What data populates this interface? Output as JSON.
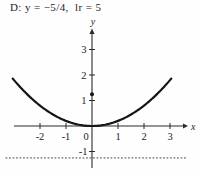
{
  "title": "D: y = −5/4,  lr = 5",
  "chart_data": {
    "type": "line",
    "title": "D: y = −5/4,  lr = 5",
    "equation": "y = x^2/5",
    "coefficient": 0.2,
    "x_range": [
      -3.05,
      3.05
    ],
    "xlabel": "x",
    "ylabel": "y",
    "x_tick_values": [
      -2,
      -1,
      1,
      2,
      3
    ],
    "x_tick_labels": [
      "-2",
      "-1",
      "1",
      "2",
      "3"
    ],
    "origin_label": "0",
    "y_tick_values": [
      1,
      2,
      3
    ],
    "y_tick_labels": [
      "1",
      "2",
      "3"
    ],
    "neg_y_tick_value": -1,
    "neg_y_tick_label": "-1",
    "directrix_y": -1.25,
    "focus": [
      0,
      1.25
    ],
    "xlim": [
      -3.3,
      3.6
    ],
    "ylim": [
      -1.75,
      3.8
    ],
    "grid": false,
    "legend": "none",
    "curve_color": "#161616",
    "axis_color": "#2b2b2b",
    "directrix_color": "#6a6a6a"
  }
}
